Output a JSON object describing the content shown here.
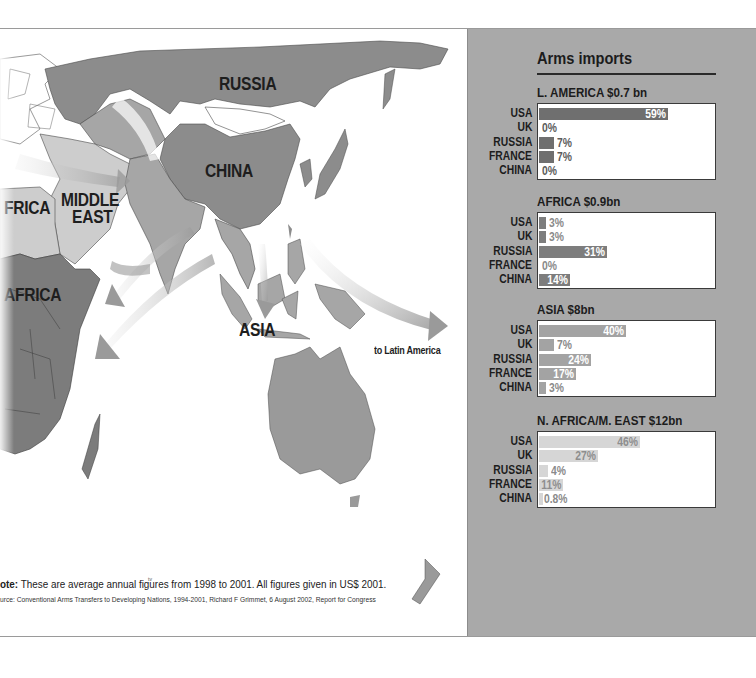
{
  "map": {
    "labels": {
      "russia": "RUSSIA",
      "china": "CHINA",
      "middle_east_1": "MIDDLE",
      "middle_east_2": "EAST",
      "n_africa": "FRICA",
      "africa": "AFRICA",
      "asia": "ASIA",
      "to_latin_america": "to Latin America"
    },
    "colors": {
      "land_dark": "#8c8c8c",
      "land_mid": "#a6a6a6",
      "land_light": "#cdcdcd",
      "land_white": "#ffffff",
      "arrow": "#9e9e9e",
      "border": "#4a4a4a"
    }
  },
  "footer": {
    "note_label": "ote:",
    "note_text": " These are average annual figures from 1998 to 2001. All figures given in US$ 2001.",
    "source_text": "urce: Conventional Arms Transfers to Developing Nations, 1994-2001, Richard F Grimmet, 6 August 2002, Report for Congress"
  },
  "panel": {
    "title": "Arms imports",
    "background": "#a9a9a9"
  },
  "chart_data": {
    "type": "bar",
    "title": "Arms imports",
    "orientation": "horizontal",
    "unit": "% share of region's arms imports",
    "categories": [
      "USA",
      "UK",
      "RUSSIA",
      "FRANCE",
      "CHINA"
    ],
    "charts": [
      {
        "region": "L. AMERICA",
        "total": "$0.7 bn",
        "title": "L. AMERICA $0.7 bn",
        "values": [
          59,
          0,
          7,
          7,
          0
        ],
        "labels": [
          "59%",
          "0%",
          "7%",
          "7%",
          "0%"
        ],
        "bar_color": "#6f6f6f"
      },
      {
        "region": "AFRICA",
        "total": "$0.9bn",
        "title": "AFRICA $0.9bn",
        "values": [
          3,
          3,
          31,
          0,
          14
        ],
        "labels": [
          "3%",
          "3%",
          "31%",
          "0%",
          "14%"
        ],
        "bar_color": "#7d7d7d"
      },
      {
        "region": "ASIA",
        "total": "$8bn",
        "title": "ASIA $8bn",
        "values": [
          40,
          7,
          24,
          17,
          3
        ],
        "labels": [
          "40%",
          "7%",
          "24%",
          "17%",
          "3%"
        ],
        "bar_color": "#a3a3a3"
      },
      {
        "region": "N. AFRICA/M. EAST",
        "total": "$12bn",
        "title": "N. AFRICA/M. EAST $12bn",
        "values": [
          46,
          27,
          4,
          11,
          0.8
        ],
        "labels": [
          "46%",
          "27%",
          "4%",
          "11%",
          "0.8%"
        ],
        "bar_color": "#d6d6d6"
      }
    ],
    "xlim": [
      0,
      100
    ],
    "grid": false,
    "legend": "none"
  }
}
